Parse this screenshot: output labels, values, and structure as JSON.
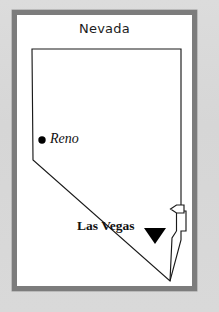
{
  "figure": {
    "title": "Nevada",
    "background_color": "#d8d8d8",
    "panel_color": "#ffffff",
    "frame_color": "#7c7c7c",
    "outline_color": "#1a1a1a",
    "marker_color": "#000000"
  },
  "map": {
    "state_name": "Nevada",
    "outline_points": "32,49 181,49 181,211 186,211 186,231 181,231 181,240 170,281 33,160 32,49",
    "cities": [
      {
        "name": "Reno",
        "label": "Reno",
        "marker": "dot-marker",
        "marker_x": 42,
        "marker_y": 140,
        "label_x": 50,
        "label_y": 131,
        "style": "italic"
      },
      {
        "name": "Las Vegas",
        "label": "Las Vegas",
        "marker": "triangle-marker",
        "marker_x": 155,
        "marker_y": 232,
        "label_x": 77,
        "label_y": 218,
        "style": "bold"
      }
    ],
    "annotations": [
      {
        "name": "flag-marker",
        "icon": "flag-icon",
        "x": 172,
        "y": 204,
        "description": "pennant flag on pole near Las Vegas"
      },
      {
        "name": "boundary-spur",
        "icon": "line-segment",
        "description": "short boundary spur line descending from flag pole to southern border"
      }
    ]
  }
}
